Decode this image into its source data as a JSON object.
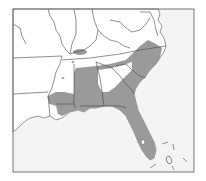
{
  "map": {
    "region": "Southeastern United States",
    "type": "species range map",
    "colors": {
      "background": "#ffffff",
      "land": "#ffffff",
      "water": "#f4f4f4",
      "range_fill": "#9a9a9a",
      "border": "#444444",
      "frame": "#555555"
    },
    "frame": {
      "x": 13,
      "y": 9,
      "width": 181,
      "height": 163
    },
    "range_shading": "gray",
    "visible_states": [
      "Missouri",
      "Illinois",
      "Indiana",
      "Kentucky",
      "Tennessee",
      "Arkansas",
      "Louisiana",
      "Mississippi",
      "Alabama",
      "Georgia",
      "Florida",
      "South Carolina",
      "North Carolina",
      "Virginia",
      "West Virginia",
      "Maryland",
      "Delaware"
    ],
    "labels": []
  }
}
